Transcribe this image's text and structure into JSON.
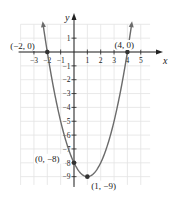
{
  "chart_data": {
    "type": "line",
    "title": "",
    "xlabel": "x",
    "ylabel": "y",
    "function": "y = x^2 - 2x - 8",
    "xlim": [
      -4,
      5.7
    ],
    "ylim": [
      -9.6,
      2
    ],
    "grid": true,
    "x_ticks": [
      -3,
      -2,
      -1,
      1,
      2,
      3,
      4,
      5
    ],
    "x_tick_labels": [
      "−3",
      "−2",
      "−1",
      "1",
      "2",
      "3",
      "4",
      "5"
    ],
    "y_ticks": [
      1,
      -1,
      -2,
      -3,
      -4,
      -5,
      -6,
      -7,
      -8,
      -9
    ],
    "y_tick_labels": [
      "1",
      "−1",
      "−2",
      "−3",
      "−4",
      "−5",
      "−6",
      "−7",
      "−8",
      "−9"
    ],
    "series": [
      {
        "name": "parabola",
        "x": [
          -2.3,
          -2,
          -1,
          0,
          1,
          2,
          3,
          4,
          4.3
        ],
        "y": [
          1.89,
          0,
          -5,
          -8,
          -9,
          -8,
          -5,
          0,
          1.89
        ]
      }
    ],
    "points": [
      {
        "x": -2,
        "y": 0,
        "label": "(−2, 0)"
      },
      {
        "x": 4,
        "y": 0,
        "label": "(4, 0)"
      },
      {
        "x": 0,
        "y": -8,
        "label": "(0, −8)"
      },
      {
        "x": 1,
        "y": -9,
        "label": "(1, −9)"
      }
    ]
  },
  "colors": {
    "curve": "#6b6b6b",
    "axis": "#222222",
    "grid": "#e3e3e3",
    "point": "#333333"
  }
}
